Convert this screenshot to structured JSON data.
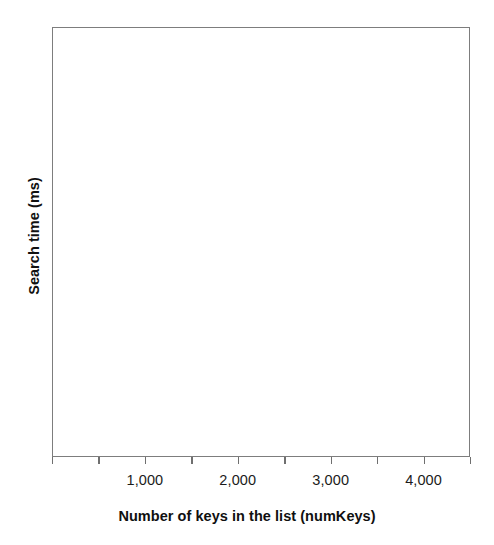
{
  "chart_data": {
    "type": "line",
    "title": "",
    "subtitle": "",
    "xlabel": "Number of keys in the list (numKeys)",
    "ylabel": "Search time (ms)",
    "xlim": [
      0,
      4500
    ],
    "ylim": [
      0,
      1
    ],
    "grid": false,
    "legend": null,
    "legend_position": "none",
    "series": [],
    "x": [],
    "values": [],
    "annotations": [],
    "x_major_ticks": [
      1000,
      2000,
      3000,
      4000
    ],
    "x_minor_ticks": [
      0,
      500,
      1500,
      2500,
      3500,
      4500
    ],
    "x_tick_labels": [
      "1,000",
      "2,000",
      "3,000",
      "4,000"
    ],
    "y_tick_labels": [],
    "note": "Empty plot frame: axes drawn with no plotted data"
  },
  "axes": {
    "frame_color": "#7d7d7d",
    "tick_color": "#6f6f6f",
    "label_color": "#1b1b1b",
    "title_color": "#101010",
    "background": "#ffffff"
  },
  "x_axis": {
    "title": "Number of keys in the list (numKeys)",
    "ticks": [
      {
        "value": 0,
        "label": "",
        "major": false
      },
      {
        "value": 500,
        "label": "",
        "major": false
      },
      {
        "value": 1000,
        "label": "1,000",
        "major": true
      },
      {
        "value": 1500,
        "label": "",
        "major": false
      },
      {
        "value": 2000,
        "label": "2,000",
        "major": true
      },
      {
        "value": 2500,
        "label": "",
        "major": false
      },
      {
        "value": 3000,
        "label": "3,000",
        "major": true
      },
      {
        "value": 3500,
        "label": "",
        "major": false
      },
      {
        "value": 4000,
        "label": "4,000",
        "major": true
      },
      {
        "value": 4500,
        "label": "",
        "major": false
      }
    ]
  },
  "y_axis": {
    "title": "Search time (ms)",
    "ticks": []
  }
}
